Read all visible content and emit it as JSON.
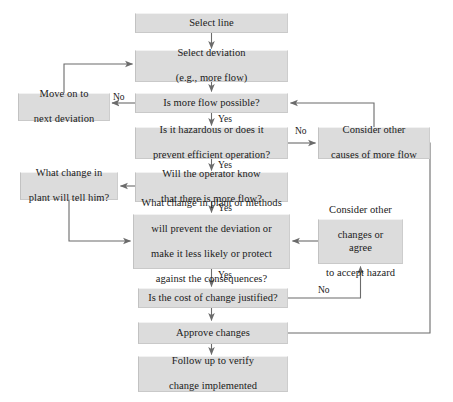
{
  "diagram": {
    "colors": {
      "node_fill": "#dcdcdc",
      "node_border": "#c2c2c2",
      "line": "#6b6b6b",
      "text": "#1a1a1a",
      "background": "#ffffff"
    },
    "nodes": [
      {
        "id": "select-line",
        "label": "Select line",
        "x": 135,
        "y": 13,
        "w": 153,
        "h": 20,
        "lines": [
          "Select line"
        ]
      },
      {
        "id": "select-deviation",
        "label": "Select deviation (e.g., more flow)",
        "x": 135,
        "y": 50,
        "w": 153,
        "h": 32,
        "lines": [
          "Select deviation",
          "(e.g., more flow)"
        ]
      },
      {
        "id": "move-on",
        "label": "Move on to next deviation",
        "x": 18,
        "y": 93,
        "w": 92,
        "h": 28,
        "lines": [
          "Move on to",
          "next deviation"
        ]
      },
      {
        "id": "more-flow-possible",
        "label": "Is more flow possible?",
        "x": 135,
        "y": 93,
        "w": 153,
        "h": 20,
        "lines": [
          "Is more flow possible?"
        ]
      },
      {
        "id": "hazardous",
        "label": "Is it hazardous or does it prevent efficient operation?",
        "x": 135,
        "y": 127,
        "w": 153,
        "h": 32,
        "lines": [
          "Is it hazardous or does it",
          "prevent efficient operation?"
        ]
      },
      {
        "id": "consider-causes",
        "label": "Consider other causes of more flow",
        "x": 318,
        "y": 127,
        "w": 112,
        "h": 32,
        "lines": [
          "Consider other",
          "causes of more flow"
        ]
      },
      {
        "id": "what-change-plant",
        "label": "What change in plant will tell him?",
        "x": 20,
        "y": 172,
        "w": 98,
        "h": 28,
        "lines": [
          "What change in",
          "plant will tell him?"
        ]
      },
      {
        "id": "operator-know",
        "label": "Will the operator know that there is more flow?",
        "x": 135,
        "y": 172,
        "w": 153,
        "h": 30,
        "lines": [
          "Will the operator know",
          "that there is more flow?"
        ]
      },
      {
        "id": "what-change-methods",
        "label": "What change in plant or methods will prevent the deviation or make it less likely or protect against the consequences?",
        "x": 133,
        "y": 214,
        "w": 157,
        "h": 55,
        "lines": [
          "What change in plant or methods",
          "will prevent the deviation or",
          "make it less likely or protect",
          "against the consequences?"
        ]
      },
      {
        "id": "consider-changes",
        "label": "Consider other changes or agree to accept hazard",
        "x": 318,
        "y": 219,
        "w": 85,
        "h": 45,
        "lines": [
          "Consider other",
          "changes or agree",
          "to accept hazard"
        ]
      },
      {
        "id": "cost-justified",
        "label": "Is the cost of change justified?",
        "x": 138,
        "y": 288,
        "w": 150,
        "h": 20,
        "lines": [
          "Is the cost of change justified?"
        ]
      },
      {
        "id": "approve-changes",
        "label": "Approve changes",
        "x": 138,
        "y": 322,
        "w": 150,
        "h": 22,
        "lines": [
          "Approve changes"
        ]
      },
      {
        "id": "follow-up",
        "label": "Follow up to verify change implemented",
        "x": 138,
        "y": 356,
        "w": 150,
        "h": 36,
        "lines": [
          "Follow up to verify",
          "change implemented"
        ]
      }
    ],
    "edge_labels": [
      {
        "id": "no-more-flow",
        "text": "No",
        "x": 113,
        "y": 92
      },
      {
        "id": "yes-more-flow",
        "text": "Yes",
        "x": 218,
        "y": 115
      },
      {
        "id": "no-hazardous",
        "text": "No",
        "x": 295,
        "y": 126
      },
      {
        "id": "yes-hazardous",
        "text": "Yes",
        "x": 218,
        "y": 160
      },
      {
        "id": "yes-operator",
        "text": "Yes",
        "x": 218,
        "y": 203
      },
      {
        "id": "yes-methods",
        "text": "Yes",
        "x": 218,
        "y": 271
      },
      {
        "id": "no-cost",
        "text": "No",
        "x": 318,
        "y": 286
      }
    ]
  }
}
